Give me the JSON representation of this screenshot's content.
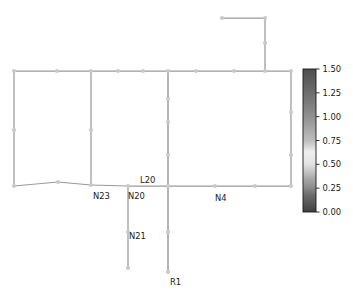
{
  "chart_data": {
    "type": "line",
    "title": "",
    "xlabel": "",
    "ylabel": "",
    "grid": false,
    "legend_position": "none",
    "colorbar": {
      "orientation": "vertical",
      "position": "right",
      "vmin": 0.0,
      "vmax": 1.5,
      "tick_labels": [
        "1.50",
        "1.25",
        "1.00",
        "0.75",
        "0.50",
        "0.25",
        "0.00"
      ],
      "tick_values": [
        1.5,
        1.25,
        1.0,
        0.75,
        0.5,
        0.25,
        0.0
      ],
      "colormap_stops": [
        {
          "value": 1.5,
          "color": "#4d4d4d"
        },
        {
          "value": 1.25,
          "color": "#6e6e6e"
        },
        {
          "value": 1.0,
          "color": "#909090"
        },
        {
          "value": 0.75,
          "color": "#bdbdbd"
        },
        {
          "value": 0.5,
          "color": "#e2e2e2"
        },
        {
          "value": 0.35,
          "color": "#a8a8a8"
        },
        {
          "value": 0.25,
          "color": "#8a8a8a"
        },
        {
          "value": 0.0,
          "color": "#3f3f3f"
        }
      ]
    },
    "node_marker_color": "#c9c9c9",
    "edge_color": "#707070",
    "edge_color_light": "#c9c9c9",
    "annotations": [
      {
        "text": "N23",
        "x": 93,
        "y": 199,
        "value": 0.3
      },
      {
        "text": "N20",
        "x": 128,
        "y": 199,
        "value": 0.3
      },
      {
        "text": "L20",
        "x": 140,
        "y": 183,
        "value": 1.05
      },
      {
        "text": "N4",
        "x": 215,
        "y": 201,
        "value": 0.3
      },
      {
        "text": "N21",
        "x": 129,
        "y": 239,
        "value": 0.3
      },
      {
        "text": "R1",
        "x": 170,
        "y": 285,
        "value": 1.05
      }
    ],
    "nodes": [
      {
        "id": "n-tl",
        "x": 14,
        "y": 71
      },
      {
        "id": "n-t1",
        "x": 57,
        "y": 71
      },
      {
        "id": "n-t2",
        "x": 91,
        "y": 71
      },
      {
        "id": "n-t3",
        "x": 118,
        "y": 71
      },
      {
        "id": "n-t4",
        "x": 143,
        "y": 71
      },
      {
        "id": "n-t5",
        "x": 168,
        "y": 71
      },
      {
        "id": "n-t6",
        "x": 196,
        "y": 71
      },
      {
        "id": "n-t7",
        "x": 234,
        "y": 71
      },
      {
        "id": "n-t8",
        "x": 265,
        "y": 71
      },
      {
        "id": "n-tr",
        "x": 291,
        "y": 71
      },
      {
        "id": "n-lmid",
        "x": 14,
        "y": 130
      },
      {
        "id": "n-bl",
        "x": 14,
        "y": 186
      },
      {
        "id": "n-b1",
        "x": 58,
        "y": 182
      },
      {
        "id": "n-b2",
        "x": 91,
        "y": 185
      },
      {
        "id": "n-b3",
        "x": 128,
        "y": 186
      },
      {
        "id": "n-b4",
        "x": 168,
        "y": 186
      },
      {
        "id": "n-b5",
        "x": 215,
        "y": 186
      },
      {
        "id": "n-b6",
        "x": 255,
        "y": 186
      },
      {
        "id": "n-br",
        "x": 291,
        "y": 186
      },
      {
        "id": "n-m1",
        "x": 91,
        "y": 130
      },
      {
        "id": "n-c1",
        "x": 168,
        "y": 99
      },
      {
        "id": "n-c2",
        "x": 168,
        "y": 122
      },
      {
        "id": "n-c3",
        "x": 168,
        "y": 155
      },
      {
        "id": "n-r1",
        "x": 291,
        "y": 112
      },
      {
        "id": "n-r2",
        "x": 291,
        "y": 155
      },
      {
        "id": "n-brtop",
        "x": 222,
        "y": 18
      },
      {
        "id": "n-brcor",
        "x": 265,
        "y": 18
      },
      {
        "id": "n-brmid",
        "x": 265,
        "y": 43
      },
      {
        "id": "n-n21a",
        "x": 128,
        "y": 232
      },
      {
        "id": "n-n21b",
        "x": 128,
        "y": 268
      },
      {
        "id": "n-r1a",
        "x": 168,
        "y": 232
      },
      {
        "id": "n-r1b",
        "x": 168,
        "y": 272
      }
    ],
    "edges": [
      {
        "from": "n-tl",
        "to": "n-t1",
        "value": 0.3
      },
      {
        "from": "n-t1",
        "to": "n-t2",
        "value": 0.3
      },
      {
        "from": "n-t2",
        "to": "n-t3",
        "value": 0.3
      },
      {
        "from": "n-t3",
        "to": "n-t4",
        "value": 0.3
      },
      {
        "from": "n-t4",
        "to": "n-t5",
        "value": 0.3
      },
      {
        "from": "n-t5",
        "to": "n-t6",
        "value": 0.3
      },
      {
        "from": "n-t6",
        "to": "n-t7",
        "value": 0.3
      },
      {
        "from": "n-t7",
        "to": "n-t8",
        "value": 0.3
      },
      {
        "from": "n-t8",
        "to": "n-tr",
        "value": 0.3
      },
      {
        "from": "n-tl",
        "to": "n-lmid",
        "value": 0.3
      },
      {
        "from": "n-lmid",
        "to": "n-bl",
        "value": 0.3
      },
      {
        "from": "n-bl",
        "to": "n-b1",
        "value": 0.3
      },
      {
        "from": "n-b1",
        "to": "n-b2",
        "value": 0.3
      },
      {
        "from": "n-b2",
        "to": "n-b3",
        "value": 0.3
      },
      {
        "from": "n-b3",
        "to": "n-b4",
        "value": 0.3
      },
      {
        "from": "n-b4",
        "to": "n-b5",
        "value": 0.3
      },
      {
        "from": "n-b5",
        "to": "n-b6",
        "value": 0.3
      },
      {
        "from": "n-b6",
        "to": "n-br",
        "value": 0.3
      },
      {
        "from": "n-tr",
        "to": "n-r1",
        "value": 0.3
      },
      {
        "from": "n-r1",
        "to": "n-r2",
        "value": 0.3
      },
      {
        "from": "n-r2",
        "to": "n-br",
        "value": 0.3
      },
      {
        "from": "n-t2",
        "to": "n-m1",
        "value": 0.3
      },
      {
        "from": "n-m1",
        "to": "n-b2",
        "value": 0.3
      },
      {
        "from": "n-t5",
        "to": "n-c1",
        "value": 1.05
      },
      {
        "from": "n-c1",
        "to": "n-c2",
        "value": 1.05
      },
      {
        "from": "n-c2",
        "to": "n-c3",
        "value": 1.05
      },
      {
        "from": "n-c3",
        "to": "n-b4",
        "value": 1.05
      },
      {
        "from": "n-brtop",
        "to": "n-brcor",
        "value": 0.3
      },
      {
        "from": "n-brcor",
        "to": "n-brmid",
        "value": 0.3
      },
      {
        "from": "n-brmid",
        "to": "n-t8",
        "value": 0.3
      },
      {
        "from": "n-b3",
        "to": "n-n21a",
        "value": 0.3
      },
      {
        "from": "n-n21a",
        "to": "n-n21b",
        "value": 0.3
      },
      {
        "from": "n-b4",
        "to": "n-r1a",
        "value": 1.05
      },
      {
        "from": "n-r1a",
        "to": "n-r1b",
        "value": 1.05
      }
    ]
  },
  "figure": {
    "background": "#ffffff",
    "axes_visible": false
  }
}
